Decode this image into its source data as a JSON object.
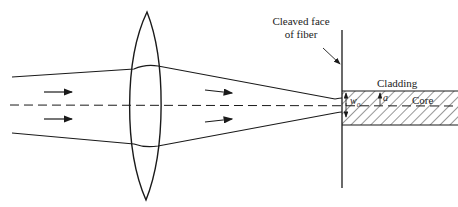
{
  "diagram": {
    "labels": {
      "cleaved_face_line1": "Cleaved face",
      "cleaved_face_line2": "of fiber",
      "cladding": "Cladding",
      "core": "Core",
      "waist": "w",
      "waist_subscript": "0",
      "core_radius": "a"
    },
    "elements": [
      "incoming beam",
      "converging lens",
      "optical axis",
      "cleaved fiber face",
      "fiber core (hatched)",
      "cladding"
    ],
    "colors": {
      "stroke": "#1a1a1a",
      "background": "#ffffff"
    }
  }
}
